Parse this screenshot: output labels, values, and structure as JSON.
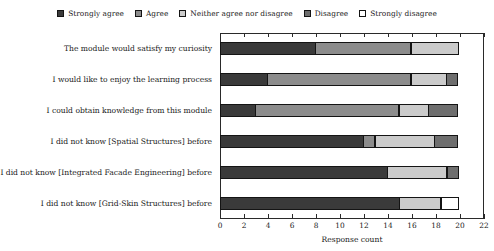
{
  "chart_data": {
    "type": "bar",
    "orientation": "horizontal",
    "stacked": true,
    "title": "",
    "xlabel": "Response count",
    "ylabel": "",
    "xlim": [
      0,
      22
    ],
    "xticks": [
      0,
      2,
      4,
      6,
      8,
      10,
      12,
      14,
      16,
      18,
      20,
      22
    ],
    "grid": false,
    "legend_position": "top-center",
    "categories": [
      "The module would satisfy my curiosity",
      "I would like to enjoy the learning process",
      "I could obtain knowledge from this module",
      "I did not know [Spatial Structures] before",
      "I did not know [Integrated Facade Engineering] before",
      "I did not know [Grid-Skin Structures] before"
    ],
    "series": [
      {
        "name": "Strongly agree",
        "color": "#3a3a3a",
        "values": [
          8,
          4,
          3,
          12,
          14,
          15
        ]
      },
      {
        "name": "Agree",
        "color": "#8c8c8c",
        "values": [
          8,
          12,
          12,
          1,
          0,
          0
        ]
      },
      {
        "name": "Neither agree nor disagree",
        "color": "#cbcbcb",
        "values": [
          4,
          3,
          2.5,
          5,
          5,
          3.5
        ]
      },
      {
        "name": "Disagree",
        "color": "#6e6e6e",
        "values": [
          0,
          1,
          2.5,
          2,
          1,
          0
        ]
      },
      {
        "name": "Strongly disagree",
        "color": "#ffffff",
        "values": [
          0,
          0,
          0,
          0,
          0,
          1.5
        ]
      }
    ]
  },
  "legend": {
    "items": [
      {
        "label": "Strongly agree",
        "color": "#3a3a3a"
      },
      {
        "label": "Agree",
        "color": "#8c8c8c"
      },
      {
        "label": "Neither agree nor disagree",
        "color": "#cbcbcb"
      },
      {
        "label": "Disagree",
        "color": "#6e6e6e"
      },
      {
        "label": "Strongly disagree",
        "color": "#ffffff"
      }
    ]
  },
  "axis": {
    "x_title": "Response count",
    "x_tick_labels": [
      "0",
      "2",
      "4",
      "6",
      "8",
      "10",
      "12",
      "14",
      "16",
      "18",
      "20",
      "22"
    ]
  }
}
